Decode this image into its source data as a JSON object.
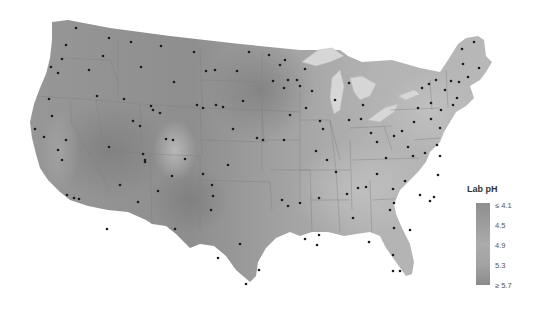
{
  "map": {
    "title": "Lab pH",
    "region": "Contiguous United States",
    "color_scheme": "grayscale",
    "colors": {
      "background": "#ffffff",
      "land_low_ph": "#bdbdbd",
      "land_mid_ph": "#a8a8a8",
      "land_high_ph": "#858585",
      "water": "#d9d9d9",
      "borders": "#8a8a8a",
      "site_dot": "#1a1a1a"
    }
  },
  "legend": {
    "title": "Lab pH",
    "ticks": [
      {
        "label": "≤ 4.1"
      },
      {
        "label": "4.5"
      },
      {
        "label": "4.9"
      },
      {
        "label": "5.3"
      },
      {
        "label": "≥ 5.7"
      }
    ]
  }
}
